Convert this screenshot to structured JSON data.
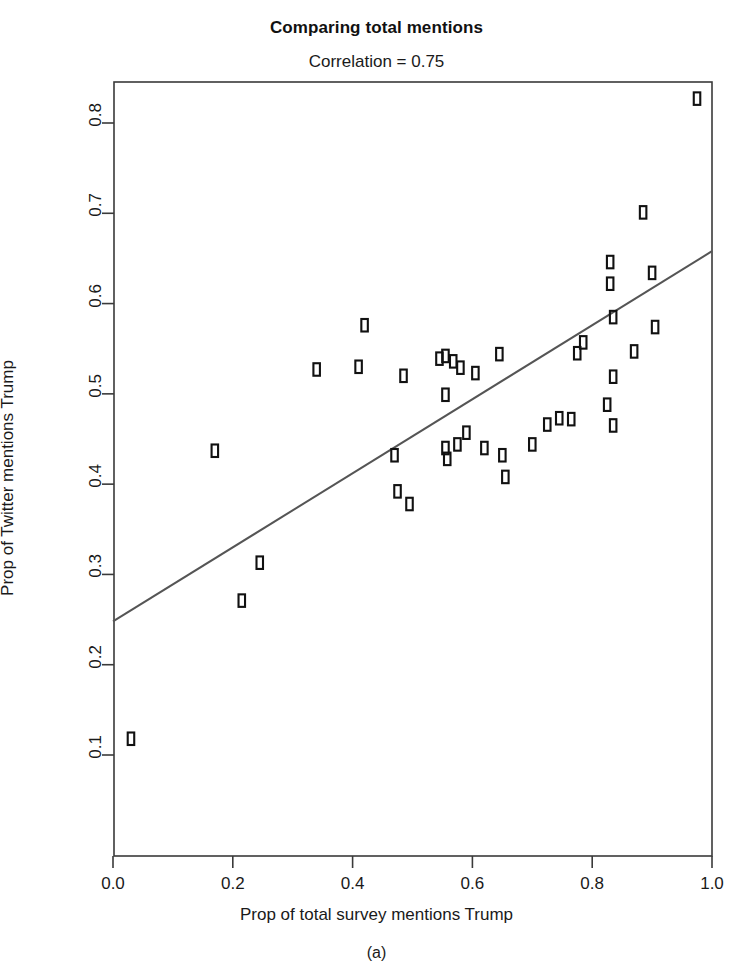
{
  "figure": {
    "title": "Comparing total mentions",
    "subtitle": "Correlation = 0.75",
    "caption": "(a)"
  },
  "chart_data": {
    "type": "scatter",
    "title": "Comparing total mentions",
    "subtitle": "Correlation = 0.75",
    "xlabel": "Prop of total survey mentions Trump",
    "ylabel": "Prop of Twitter mentions Trump",
    "correlation": 0.75,
    "xlim": [
      -0.02,
      1.02
    ],
    "ylim": [
      0.073,
      0.855
    ],
    "xticks": [
      "0.0",
      "0.2",
      "0.4",
      "0.6",
      "0.8",
      "1.0"
    ],
    "xtick_values": [
      0.0,
      0.2,
      0.4,
      0.6,
      0.8,
      1.0
    ],
    "yticks": [
      "0.1",
      "0.2",
      "0.3",
      "0.4",
      "0.5",
      "0.6",
      "0.7",
      "0.8"
    ],
    "ytick_values": [
      0.1,
      0.2,
      0.3,
      0.4,
      0.5,
      0.6,
      0.7,
      0.8
    ],
    "grid": false,
    "legend": null,
    "marker": "open-rectangle",
    "points": [
      {
        "x": 0.03,
        "y": 0.118
      },
      {
        "x": 0.17,
        "y": 0.437
      },
      {
        "x": 0.215,
        "y": 0.271
      },
      {
        "x": 0.245,
        "y": 0.313
      },
      {
        "x": 0.34,
        "y": 0.527
      },
      {
        "x": 0.41,
        "y": 0.53
      },
      {
        "x": 0.42,
        "y": 0.576
      },
      {
        "x": 0.47,
        "y": 0.432
      },
      {
        "x": 0.475,
        "y": 0.392
      },
      {
        "x": 0.485,
        "y": 0.52
      },
      {
        "x": 0.495,
        "y": 0.378
      },
      {
        "x": 0.545,
        "y": 0.539
      },
      {
        "x": 0.555,
        "y": 0.542
      },
      {
        "x": 0.555,
        "y": 0.499
      },
      {
        "x": 0.555,
        "y": 0.44
      },
      {
        "x": 0.558,
        "y": 0.428
      },
      {
        "x": 0.568,
        "y": 0.536
      },
      {
        "x": 0.575,
        "y": 0.444
      },
      {
        "x": 0.58,
        "y": 0.529
      },
      {
        "x": 0.59,
        "y": 0.457
      },
      {
        "x": 0.605,
        "y": 0.523
      },
      {
        "x": 0.62,
        "y": 0.44
      },
      {
        "x": 0.645,
        "y": 0.544
      },
      {
        "x": 0.65,
        "y": 0.432
      },
      {
        "x": 0.655,
        "y": 0.408
      },
      {
        "x": 0.7,
        "y": 0.444
      },
      {
        "x": 0.725,
        "y": 0.466
      },
      {
        "x": 0.745,
        "y": 0.473
      },
      {
        "x": 0.765,
        "y": 0.472
      },
      {
        "x": 0.775,
        "y": 0.545
      },
      {
        "x": 0.785,
        "y": 0.557
      },
      {
        "x": 0.825,
        "y": 0.488
      },
      {
        "x": 0.83,
        "y": 0.646
      },
      {
        "x": 0.83,
        "y": 0.622
      },
      {
        "x": 0.835,
        "y": 0.585
      },
      {
        "x": 0.835,
        "y": 0.519
      },
      {
        "x": 0.835,
        "y": 0.465
      },
      {
        "x": 0.87,
        "y": 0.547
      },
      {
        "x": 0.885,
        "y": 0.701
      },
      {
        "x": 0.9,
        "y": 0.634
      },
      {
        "x": 0.905,
        "y": 0.574
      },
      {
        "x": 0.975,
        "y": 0.827
      }
    ],
    "fit_line": {
      "type": "linear-fit",
      "x_start": 0.0,
      "y_start": 0.248,
      "x_end": 1.0,
      "y_end": 0.658,
      "color": "#555555"
    }
  },
  "colors": {
    "axis": "#3a3a3a",
    "marker": "#111111",
    "line": "#555555",
    "background": "#ffffff"
  }
}
